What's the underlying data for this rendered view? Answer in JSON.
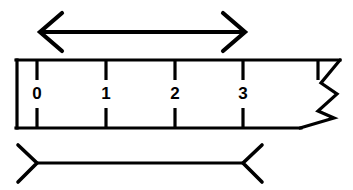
{
  "figure": {
    "ink_color": "#000000",
    "background_color": "#ffffff"
  },
  "ruler": {
    "name": "ruler-scale",
    "left_x": 17,
    "right_x": 340,
    "top_y": 60,
    "bottom_y": 128,
    "stroke_width": 3.2,
    "torn_edge": {
      "name": "torn-edge-zigzag",
      "points": "340,60 321,83 337,94 318,111 334,118 300,128",
      "stroke_width": 3.2
    },
    "labels": [
      {
        "text": "0",
        "x": 37,
        "y": 95
      },
      {
        "text": "1",
        "x": 106,
        "y": 95
      },
      {
        "text": "2",
        "x": 175,
        "y": 95
      },
      {
        "text": "3",
        "x": 243,
        "y": 95
      }
    ],
    "top_ticks": [
      {
        "x": 37,
        "y1": 60,
        "y2": 80
      },
      {
        "x": 106,
        "y1": 60,
        "y2": 80
      },
      {
        "x": 175,
        "y1": 60,
        "y2": 80
      },
      {
        "x": 243,
        "y1": 60,
        "y2": 80
      },
      {
        "x": 318,
        "y1": 60,
        "y2": 80
      }
    ],
    "bottom_ticks": [
      {
        "x": 37,
        "y1": 108,
        "y2": 128
      },
      {
        "x": 106,
        "y1": 108,
        "y2": 128
      },
      {
        "x": 175,
        "y1": 108,
        "y2": 128
      },
      {
        "x": 243,
        "y1": 108,
        "y2": 128
      }
    ]
  },
  "top_arrow": {
    "name": "double-headed-measure-arrow",
    "shaft": {
      "x1": 40,
      "y1": 32,
      "x2": 245,
      "y2": 32
    },
    "stroke_width": 4.2,
    "left_head": "62,13 40,32 62,51",
    "right_head": "223,13 245,32 223,51"
  },
  "bottom_bracket": {
    "name": "dimension-bracket",
    "shaft": {
      "x1": 37,
      "y1": 163,
      "x2": 243,
      "y2": 163
    },
    "stroke_width": 3.2,
    "left_head": "18,145 37,163 18,182",
    "right_head": "262,145 243,163 262,182"
  }
}
